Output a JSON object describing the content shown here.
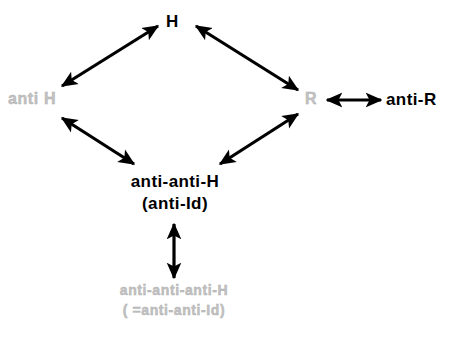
{
  "diagram": {
    "background_color": "#ffffff",
    "solid_color": "#000000",
    "ghost_color": "#c2c2c2",
    "arrow_color": "#000000",
    "nodes": {
      "h": {
        "label": "H",
        "style": "solid"
      },
      "anti_h": {
        "label": "anti H",
        "style": "ghost"
      },
      "r": {
        "label": "R",
        "style": "ghost"
      },
      "anti_r": {
        "label": "anti-R",
        "style": "solid"
      },
      "anti_anti_h": {
        "line1": "anti-anti-H",
        "line2": "(anti-Id)",
        "style": "solid"
      },
      "anti_anti_anti_h": {
        "line1": "anti-anti-anti-H",
        "line2": "( =anti-anti-Id)",
        "style": "ghost"
      }
    },
    "edges": [
      {
        "name": "anti-h-to-h",
        "from": "anti_h",
        "to": "h",
        "heads": "double",
        "x1": 62,
        "y1": 86,
        "x2": 158,
        "y2": 26
      },
      {
        "name": "h-to-r",
        "from": "h",
        "to": "r",
        "heads": "double",
        "x1": 196,
        "y1": 26,
        "x2": 298,
        "y2": 90
      },
      {
        "name": "anti-h-to-anti-anti-h",
        "from": "anti_h",
        "to": "anti_anti_h",
        "heads": "double",
        "x1": 62,
        "y1": 118,
        "x2": 134,
        "y2": 164
      },
      {
        "name": "anti-anti-h-to-r",
        "from": "anti_anti_h",
        "to": "r",
        "heads": "double",
        "x1": 220,
        "y1": 164,
        "x2": 298,
        "y2": 114
      },
      {
        "name": "r-to-anti-r",
        "from": "r",
        "to": "anti_r",
        "heads": "double",
        "x1": 327,
        "y1": 100,
        "x2": 381,
        "y2": 100
      },
      {
        "name": "anti-anti-h-to-anti-anti-anti-h",
        "from": "anti_anti_h",
        "to": "anti_anti_anti_h",
        "heads": "double",
        "x1": 174,
        "y1": 224,
        "x2": 174,
        "y2": 278
      }
    ]
  }
}
